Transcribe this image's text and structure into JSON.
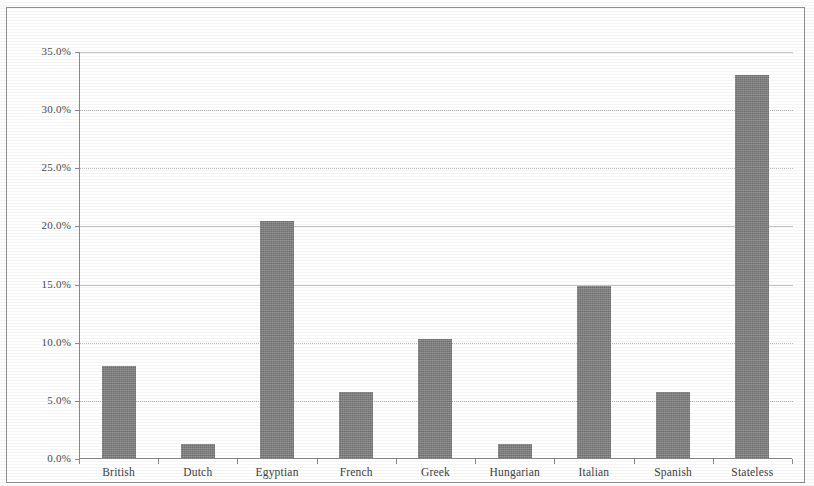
{
  "chart_data": {
    "type": "bar",
    "title": "",
    "subtitle": "",
    "xlabel": "",
    "ylabel": "",
    "categories": [
      "British",
      "Dutch",
      "Egyptian",
      "French",
      "Greek",
      "Hungarian",
      "Italian",
      "Spanish",
      "Stateless"
    ],
    "values": [
      8.0,
      1.3,
      20.5,
      5.8,
      10.3,
      1.3,
      14.9,
      5.8,
      33.0
    ],
    "value_labels": [
      "8.0%",
      "1.3%",
      "20.5%",
      "5.8%",
      "10.3%",
      "1.3%",
      "14.9%",
      "5.8%",
      "33.0%"
    ],
    "ylim": [
      0,
      35
    ],
    "ytick_values": [
      0,
      5,
      10,
      15,
      20,
      25,
      30,
      35
    ],
    "ytick_labels": [
      "0.0%",
      "5.0%",
      "10.0%",
      "15.0%",
      "20.0%",
      "25.0%",
      "30.0%",
      "35.0%"
    ],
    "grid": true,
    "grid_axis": "y",
    "legend": false,
    "legend_position": "none",
    "bar_color": "#7e7e7e",
    "axis_color": "#8a8a8a",
    "gridline_color": "#b4b4b4",
    "background_color": "#ffffff",
    "annotations": []
  }
}
